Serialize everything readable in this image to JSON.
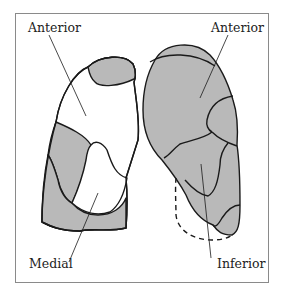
{
  "diagram": {
    "labels": {
      "left_anterior": "Anterior",
      "right_anterior": "Anterior",
      "medial": "Medial",
      "inferior": "Inferior"
    },
    "colors": {
      "fill": "#b9b9b9",
      "stroke": "#1a1a1a",
      "frame": "#8a8a8a"
    }
  }
}
